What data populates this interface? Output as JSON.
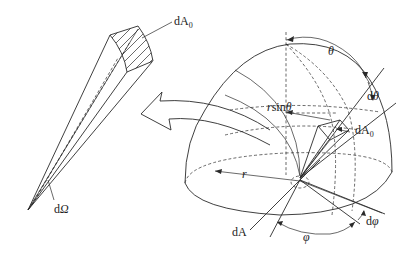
{
  "figure": {
    "labels": {
      "dA0_cone": {
        "main": "dA",
        "sub": "0"
      },
      "dOmega": {
        "main": "d",
        "italic": "Ω"
      },
      "theta": "θ",
      "dtheta": {
        "main": "d",
        "italic": "θ"
      },
      "rsintheta": {
        "italic_r": "r",
        "main": "sin",
        "italic_theta": "θ"
      },
      "dA0_sphere": {
        "main": "dA",
        "sub": "0"
      },
      "r": "r",
      "dA": "dA",
      "phi": "φ",
      "dphi": {
        "main": "d",
        "italic": "φ"
      }
    }
  }
}
